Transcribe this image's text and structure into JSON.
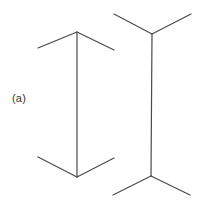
{
  "figure": {
    "panel_label": "(a)",
    "caption_label": "(a)",
    "background_color": "#ffffff",
    "stroke_color": "#4a4a4a",
    "stroke_width": 1.2,
    "width": 211,
    "height": 205
  },
  "chart_data": {
    "type": "diagram",
    "subtitle": "(a)",
    "xlabel": "",
    "ylabel": "",
    "grid": false,
    "legend": null,
    "xlim": [
      0,
      211
    ],
    "ylim": [
      0,
      205
    ],
    "annotations": [
      {
        "text": "(a)",
        "x": 12,
        "y": 98
      }
    ],
    "shapes": [
      {
        "name": "left-figure-shaft",
        "type": "line",
        "points": [
          [
            77,
            32
          ],
          [
            77,
            177
          ]
        ],
        "stroke": "#4a4a4a"
      },
      {
        "name": "left-figure-top-left-fin",
        "type": "line",
        "points": [
          [
            77,
            32
          ],
          [
            38,
            48
          ]
        ],
        "stroke": "#4a4a4a"
      },
      {
        "name": "left-figure-top-right-fin",
        "type": "line",
        "points": [
          [
            77,
            32
          ],
          [
            114,
            50
          ]
        ],
        "stroke": "#4a4a4a"
      },
      {
        "name": "left-figure-bottom-left-fin",
        "type": "line",
        "points": [
          [
            77,
            177
          ],
          [
            38,
            157
          ]
        ],
        "stroke": "#4a4a4a"
      },
      {
        "name": "left-figure-bottom-right-fin",
        "type": "line",
        "points": [
          [
            77,
            177
          ],
          [
            114,
            158
          ]
        ],
        "stroke": "#4a4a4a"
      },
      {
        "name": "right-figure-shaft",
        "type": "line",
        "points": [
          [
            152,
            34
          ],
          [
            151,
            176
          ]
        ],
        "stroke": "#4a4a4a"
      },
      {
        "name": "right-figure-top-left-fin",
        "type": "line",
        "points": [
          [
            152,
            34
          ],
          [
            114,
            14
          ]
        ],
        "stroke": "#4a4a4a"
      },
      {
        "name": "right-figure-top-right-fin",
        "type": "line",
        "points": [
          [
            152,
            34
          ],
          [
            191,
            14
          ]
        ],
        "stroke": "#4a4a4a"
      },
      {
        "name": "right-figure-bottom-left-fin",
        "type": "line",
        "points": [
          [
            151,
            176
          ],
          [
            113,
            195
          ]
        ],
        "stroke": "#4a4a4a"
      },
      {
        "name": "right-figure-bottom-right-fin",
        "type": "line",
        "points": [
          [
            151,
            176
          ],
          [
            190,
            195
          ]
        ],
        "stroke": "#4a4a4a"
      }
    ]
  }
}
